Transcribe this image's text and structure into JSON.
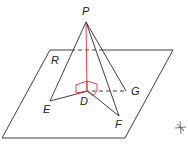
{
  "diagram": {
    "type": "3d-geometry-pyramid-over-plane",
    "colors": {
      "line": "#2a2a2a",
      "perpendicular": "#d9302c",
      "background": "#ffffff"
    },
    "labels": {
      "apex": "P",
      "plane": "R",
      "foot": "D",
      "point_e": "E",
      "point_f": "F",
      "point_g": "G"
    },
    "mark": "✱"
  }
}
